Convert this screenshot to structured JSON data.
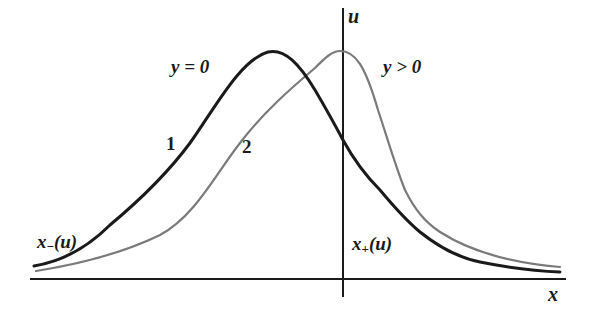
{
  "diagram": {
    "axes": {
      "x_label": "x",
      "y_label": "u"
    },
    "curves": [
      {
        "id": "1",
        "number_label": "1",
        "condition_label": "y = 0",
        "color": "#1a1a1a",
        "style": "thick solid"
      },
      {
        "id": "2",
        "number_label": "2",
        "condition_label": "y > 0",
        "color": "#7a7a7a",
        "style": "thin solid"
      }
    ],
    "branch_labels": {
      "left": {
        "main": "x",
        "sub": "−",
        "arg": "(u)"
      },
      "right": {
        "main": "x",
        "sub": "+",
        "arg": "(u)"
      }
    },
    "colors": {
      "background": "#ffffff",
      "axis": "#1a1a1a",
      "curve1": "#1a1a1a",
      "curve2": "#7a7a7a"
    }
  }
}
